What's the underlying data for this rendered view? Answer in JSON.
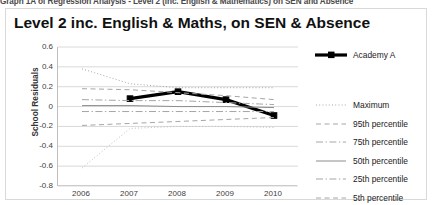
{
  "document": {
    "caption": "Graph 1A of Regression Analysis - Level 2 (inc. English & Mathematics) on SEN and Absence"
  },
  "chart": {
    "title": "Level 2 inc. English & Maths, on SEN & Absence",
    "ylabel": "School Residuals"
  },
  "legend": {
    "items": [
      {
        "label": "Academy A",
        "style": "solid-thick-marker",
        "color": "#000000"
      },
      {
        "label": "Maximum",
        "style": "dotted",
        "color": "#a6a6a6"
      },
      {
        "label": "95th percentile",
        "style": "dashed",
        "color": "#a6a6a6"
      },
      {
        "label": "75th percentile",
        "style": "dash-dot",
        "color": "#a6a6a6"
      },
      {
        "label": "50th percentile",
        "style": "solid",
        "color": "#8c8c8c"
      },
      {
        "label": "25th percentile",
        "style": "dash-dot",
        "color": "#a6a6a6"
      },
      {
        "label": "5th percentile",
        "style": "dashed",
        "color": "#a6a6a6"
      },
      {
        "label": "Minimum",
        "style": "dotted",
        "color": "#bfbfbf"
      }
    ]
  },
  "chart_data": {
    "type": "line",
    "title": "Level 2 inc. English & Maths, on SEN & Absence",
    "xlabel": "",
    "ylabel": "School Residuals",
    "x": [
      2006,
      2007,
      2008,
      2009,
      2010
    ],
    "xticklabels": [
      "2006",
      "2007",
      "2008",
      "2009",
      "2010"
    ],
    "yticklabels": [
      "0.6",
      "0.4",
      "0.2",
      "0",
      "-0.2",
      "-0.4",
      "-0.6",
      "-0.8"
    ],
    "ylim": [
      -0.8,
      0.6
    ],
    "ytick_step": 0.2,
    "grid": "horizontal",
    "legend_position": "right",
    "series": [
      {
        "name": "Academy A",
        "style": "solid-thick-marker",
        "color": "#000000",
        "values": [
          null,
          0.08,
          0.15,
          0.07,
          -0.09
        ]
      },
      {
        "name": "Maximum",
        "style": "dotted",
        "color": "#a6a6a6",
        "values": [
          0.38,
          0.23,
          0.19,
          0.19,
          0.19
        ]
      },
      {
        "name": "95th percentile",
        "style": "dashed",
        "color": "#a6a6a6",
        "values": [
          0.18,
          0.17,
          0.14,
          0.11,
          0.07
        ]
      },
      {
        "name": "75th percentile",
        "style": "dash-dot",
        "color": "#a6a6a6",
        "values": [
          0.07,
          0.06,
          0.06,
          0.04,
          0.02
        ]
      },
      {
        "name": "50th percentile",
        "style": "solid",
        "color": "#8c8c8c",
        "values": [
          0.01,
          0.01,
          0.0,
          0.0,
          -0.01
        ]
      },
      {
        "name": "25th percentile",
        "style": "dash-dot",
        "color": "#a6a6a6",
        "values": [
          -0.05,
          -0.05,
          -0.05,
          -0.05,
          -0.05
        ]
      },
      {
        "name": "5th percentile",
        "style": "dashed",
        "color": "#a6a6a6",
        "values": [
          -0.19,
          -0.17,
          -0.15,
          -0.13,
          -0.11
        ]
      },
      {
        "name": "Minimum",
        "style": "dotted",
        "color": "#bfbfbf",
        "values": [
          -0.62,
          -0.22,
          -0.2,
          -0.2,
          -0.21
        ]
      }
    ]
  }
}
